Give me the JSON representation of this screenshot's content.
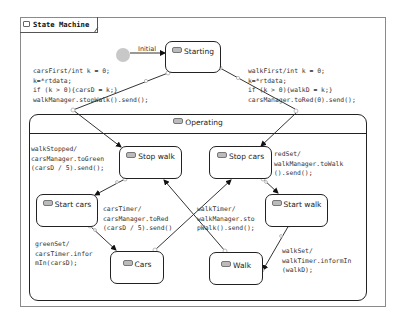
{
  "diagram": {
    "title": "State Machine",
    "initial_label": "Initial",
    "states": {
      "starting": "Starting",
      "operating": "Operating",
      "stop_walk": "Stop walk",
      "stop_cars": "Stop cars",
      "start_cars": "Start cars",
      "start_walk": "Start walk",
      "cars": "Cars",
      "walk": "Walk"
    },
    "transitions": {
      "cars_first": "carsFirst/int k = 0;\nk=*rtdata;\nif (k > 0){carsD = k;}\nwalkManager.stopWalk().send();",
      "walk_first": "walkFirst/int k = 0;\nk=*rtdata;\nif (k > 0){walkD = k;}\ncarsManager.toRed(0).send();",
      "walk_stopped": "walkStopped/\ncarsManager.toGreen\n(carsD / 5).send();",
      "red_set": "redSet/\nwalkManager.toWalk\n().send();",
      "cars_timer": "carsTimer/\ncarsManager.toRed\n(carsD / 5).send()",
      "walk_timer": "walkTimer/\nwalkManager.sto\npWalk().send();",
      "green_set": "greenSet/\ncarsTimer.infor\nmIn(carsD);",
      "walk_set": "walkSet/\nwalkTimer.informIn\n(walkD);"
    }
  }
}
